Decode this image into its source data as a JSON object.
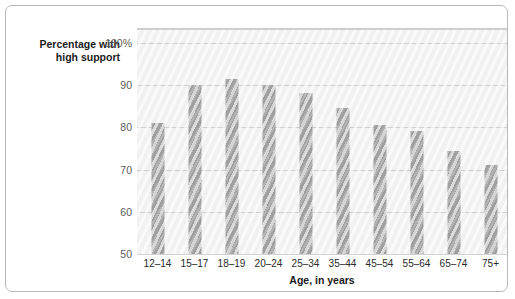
{
  "chart_data": {
    "type": "bar",
    "title": "",
    "subtitle": "",
    "ylabel_line1": "Percentage with",
    "ylabel_line2": "high support",
    "xlabel": "Age, in years",
    "categories": [
      "12–14",
      "15–17",
      "18–19",
      "20–24",
      "25–34",
      "35–44",
      "45–54",
      "55–64",
      "65–74",
      "75+"
    ],
    "values": [
      81,
      90,
      91.5,
      90,
      88,
      84.5,
      80.5,
      79,
      74.5,
      71
    ],
    "ylim": [
      50,
      103
    ],
    "yticks": [
      50,
      60,
      70,
      80,
      90,
      100
    ],
    "ytick_labels": [
      "50",
      "60",
      "70",
      "80",
      "90",
      "100%"
    ],
    "grid": true,
    "legend": "none",
    "bar_color": "#a7a7a7",
    "plot_background": "#f4f4f4",
    "gridline_color": "#d2d2d2",
    "frame_color": "#b9b9b9"
  }
}
